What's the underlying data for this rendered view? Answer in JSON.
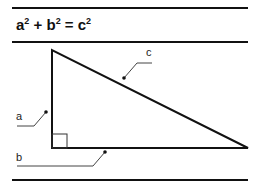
{
  "formula": {
    "a": "a",
    "b": "b",
    "c": "c",
    "exp": "2",
    "plus": " + ",
    "equals": " = "
  },
  "diagram": {
    "type": "right-triangle",
    "labels": {
      "a": "a",
      "b": "b",
      "c": "c"
    },
    "vertices": {
      "top": [
        52,
        50
      ],
      "right_angle": [
        52,
        148
      ],
      "right": [
        248,
        148
      ]
    },
    "line_color": "#111111",
    "leader_color": "#333333"
  }
}
